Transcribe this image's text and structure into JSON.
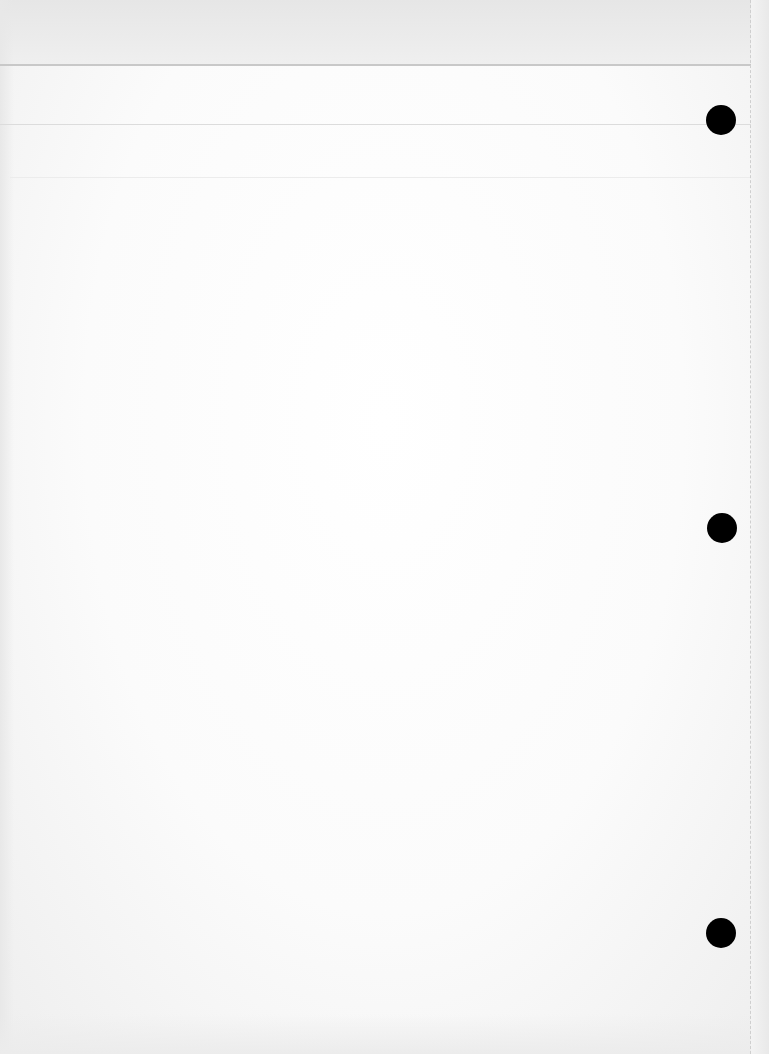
{
  "document": {
    "type": "scanned blank three-hole-punched sheet",
    "text_content": "",
    "holes": [
      {
        "cx": 721,
        "cy": 120,
        "r": 15
      },
      {
        "cx": 722,
        "cy": 528,
        "r": 15
      },
      {
        "cx": 721,
        "cy": 933,
        "r": 15
      }
    ],
    "rules": [
      {
        "y": 64
      },
      {
        "y": 124
      },
      {
        "y": 177
      }
    ],
    "margin_line_x": 750,
    "colors": {
      "paper": "#fbfbfb",
      "top_strip": "#e8e8e8",
      "rule": "#c8c8c8",
      "hole": "#000000"
    }
  }
}
